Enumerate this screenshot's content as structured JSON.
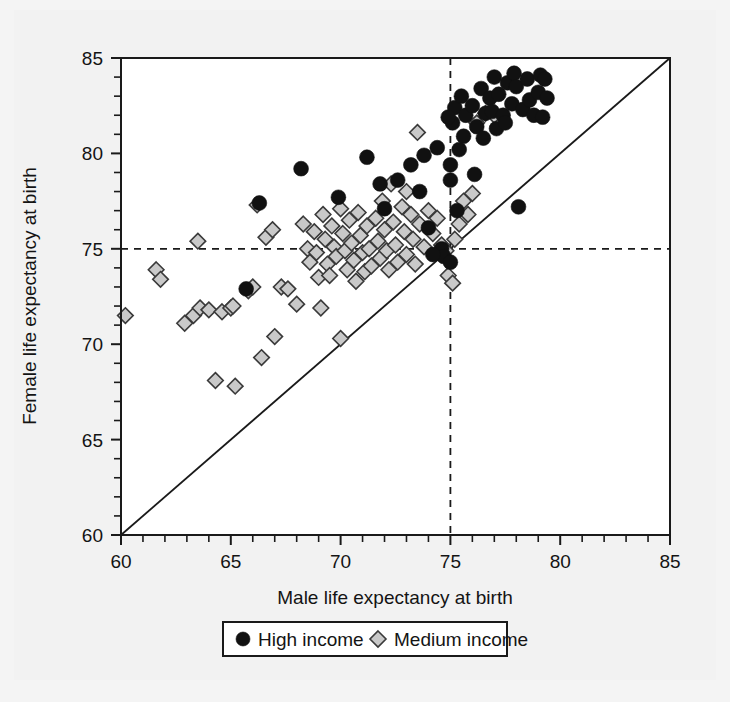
{
  "chart_data": {
    "type": "scatter",
    "title": "",
    "xlabel": "Male life expectancy at birth",
    "ylabel": "Female life expectancy at birth",
    "xlim": [
      60,
      85
    ],
    "ylim": [
      60,
      85
    ],
    "x_ticks": [
      60,
      65,
      70,
      75,
      80,
      85
    ],
    "y_ticks": [
      60,
      65,
      70,
      75,
      80,
      85
    ],
    "x_tick_labels": [
      "60",
      "65",
      "70",
      "75",
      "80",
      "85"
    ],
    "y_tick_labels": [
      "60",
      "65",
      "70",
      "75",
      "80",
      "85"
    ],
    "minor_tick_step": 1,
    "grid": false,
    "legend_position": "bottom-center",
    "reference_lines": [
      {
        "name": "vertical-75",
        "orientation": "vertical",
        "value": 75,
        "style": "dashed"
      },
      {
        "name": "horizontal-75",
        "orientation": "horizontal",
        "value": 75,
        "style": "dashed"
      },
      {
        "name": "identity-line",
        "orientation": "diagonal",
        "from": [
          60,
          60
        ],
        "to": [
          85,
          85
        ],
        "style": "solid"
      }
    ],
    "series": [
      {
        "name": "High income",
        "marker": "circle",
        "color": "#111111",
        "points": [
          [
            65.7,
            72.9
          ],
          [
            68.2,
            79.2
          ],
          [
            66.3,
            77.4
          ],
          [
            69.9,
            77.7
          ],
          [
            71.2,
            79.8
          ],
          [
            71.8,
            78.4
          ],
          [
            72.6,
            78.6
          ],
          [
            72.0,
            77.1
          ],
          [
            73.2,
            79.4
          ],
          [
            73.6,
            78.0
          ],
          [
            73.8,
            79.9
          ],
          [
            74.0,
            76.1
          ],
          [
            74.4,
            80.3
          ],
          [
            74.6,
            75.0
          ],
          [
            74.7,
            74.6
          ],
          [
            74.2,
            74.7
          ],
          [
            75.0,
            74.3
          ],
          [
            75.3,
            77.0
          ],
          [
            75.1,
            81.6
          ],
          [
            75.2,
            82.4
          ],
          [
            75.4,
            80.2
          ],
          [
            75.0,
            79.4
          ],
          [
            75.0,
            78.6
          ],
          [
            75.6,
            80.9
          ],
          [
            75.7,
            82.0
          ],
          [
            76.0,
            82.5
          ],
          [
            76.4,
            83.4
          ],
          [
            76.2,
            81.4
          ],
          [
            76.5,
            80.8
          ],
          [
            76.6,
            82.1
          ],
          [
            76.8,
            82.9
          ],
          [
            76.9,
            82.2
          ],
          [
            77.1,
            81.3
          ],
          [
            77.2,
            83.1
          ],
          [
            77.0,
            84.0
          ],
          [
            77.4,
            82.0
          ],
          [
            77.6,
            83.7
          ],
          [
            77.5,
            81.6
          ],
          [
            77.8,
            82.6
          ],
          [
            77.9,
            84.2
          ],
          [
            78.0,
            83.5
          ],
          [
            78.1,
            77.2
          ],
          [
            78.3,
            82.3
          ],
          [
            78.5,
            83.9
          ],
          [
            78.6,
            82.8
          ],
          [
            78.8,
            82.0
          ],
          [
            79.0,
            83.2
          ],
          [
            79.1,
            84.1
          ],
          [
            79.3,
            83.9
          ],
          [
            79.4,
            82.9
          ],
          [
            79.2,
            81.9
          ],
          [
            76.1,
            78.9
          ],
          [
            74.9,
            81.9
          ],
          [
            75.5,
            83.0
          ]
        ]
      },
      {
        "name": "Medium income",
        "marker": "diamond",
        "color": "#c9c9c9",
        "points": [
          [
            60.2,
            71.5
          ],
          [
            61.6,
            73.9
          ],
          [
            61.8,
            73.4
          ],
          [
            62.9,
            71.1
          ],
          [
            63.3,
            71.5
          ],
          [
            63.5,
            75.4
          ],
          [
            63.6,
            71.9
          ],
          [
            64.0,
            71.8
          ],
          [
            64.3,
            68.1
          ],
          [
            64.6,
            71.7
          ],
          [
            65.0,
            71.9
          ],
          [
            65.2,
            67.8
          ],
          [
            65.1,
            72.0
          ],
          [
            65.8,
            72.8
          ],
          [
            66.0,
            73.0
          ],
          [
            66.2,
            77.3
          ],
          [
            66.4,
            69.3
          ],
          [
            66.6,
            75.6
          ],
          [
            66.9,
            76.0
          ],
          [
            67.3,
            73.0
          ],
          [
            67.6,
            72.9
          ],
          [
            68.0,
            72.1
          ],
          [
            68.3,
            76.3
          ],
          [
            68.5,
            75.0
          ],
          [
            68.6,
            74.3
          ],
          [
            68.8,
            75.9
          ],
          [
            68.9,
            74.8
          ],
          [
            69.0,
            73.5
          ],
          [
            69.2,
            76.8
          ],
          [
            69.3,
            75.5
          ],
          [
            69.4,
            74.2
          ],
          [
            69.5,
            73.6
          ],
          [
            69.6,
            76.2
          ],
          [
            69.7,
            75.1
          ],
          [
            69.8,
            74.6
          ],
          [
            70.0,
            77.1
          ],
          [
            70.1,
            75.8
          ],
          [
            70.2,
            74.9
          ],
          [
            70.3,
            73.9
          ],
          [
            70.4,
            76.5
          ],
          [
            70.5,
            75.3
          ],
          [
            70.6,
            74.4
          ],
          [
            70.7,
            73.3
          ],
          [
            70.8,
            76.9
          ],
          [
            70.9,
            75.7
          ],
          [
            71.0,
            74.8
          ],
          [
            71.1,
            73.8
          ],
          [
            71.2,
            76.2
          ],
          [
            71.3,
            75.0
          ],
          [
            71.4,
            74.1
          ],
          [
            71.6,
            76.6
          ],
          [
            71.7,
            75.4
          ],
          [
            71.8,
            74.5
          ],
          [
            71.9,
            77.5
          ],
          [
            72.0,
            76.0
          ],
          [
            72.1,
            74.9
          ],
          [
            72.2,
            73.9
          ],
          [
            72.4,
            76.4
          ],
          [
            72.5,
            75.2
          ],
          [
            72.6,
            74.3
          ],
          [
            72.8,
            77.2
          ],
          [
            72.9,
            75.9
          ],
          [
            73.0,
            74.7
          ],
          [
            73.2,
            76.8
          ],
          [
            73.3,
            75.5
          ],
          [
            73.4,
            74.2
          ],
          [
            73.6,
            76.3
          ],
          [
            73.8,
            75.1
          ],
          [
            74.0,
            77.0
          ],
          [
            74.2,
            75.8
          ],
          [
            74.4,
            76.6
          ],
          [
            73.5,
            81.1
          ],
          [
            73.0,
            78.0
          ],
          [
            72.3,
            78.4
          ],
          [
            74.6,
            75.2
          ],
          [
            74.8,
            74.9
          ],
          [
            75.2,
            75.5
          ],
          [
            75.4,
            76.3
          ],
          [
            75.6,
            77.5
          ],
          [
            75.8,
            76.8
          ],
          [
            76.0,
            77.9
          ],
          [
            69.1,
            71.9
          ],
          [
            70.0,
            70.3
          ],
          [
            67.0,
            70.4
          ],
          [
            74.9,
            73.6
          ],
          [
            75.1,
            73.2
          ],
          [
            76.2,
            81.6
          ],
          [
            76.6,
            82.1
          ],
          [
            77.0,
            82.0
          ]
        ]
      }
    ]
  },
  "legend": {
    "items": [
      {
        "label": "High income",
        "marker": "circle"
      },
      {
        "label": "Medium income",
        "marker": "diamond"
      }
    ]
  },
  "colors": {
    "high_income": "#111111",
    "medium_income_fill": "#c9c9c9",
    "medium_income_stroke": "#3a3a3a",
    "axis": "#1a1a1a",
    "plot_background": "#ffffff",
    "page_background": "#f2f2f2"
  }
}
